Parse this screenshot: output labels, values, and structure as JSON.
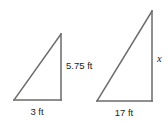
{
  "figure": {
    "background_color": "#ffffff",
    "stroke_color": "#6a6a6a",
    "text_color": "#1c1c1c",
    "title": "",
    "small_triangle": {
      "name": "small-right-triangle",
      "base_label": "3 ft",
      "height_label": "5.75 ft",
      "hypotenuse_label": "",
      "vertices": {
        "bottom_left": [
          14,
          100
        ],
        "bottom_right": [
          61,
          100
        ],
        "apex": [
          61,
          34
        ]
      }
    },
    "large_triangle": {
      "name": "large-right-triangle",
      "base_label": "17 ft",
      "height_label": "x",
      "hypotenuse_label": "",
      "vertices": {
        "bottom_left": [
          97,
          101
        ],
        "bottom_right": [
          152,
          101
        ],
        "apex": [
          152,
          11
        ]
      }
    },
    "labels": [
      {
        "id": "small-height",
        "text": "5.75 ft",
        "x": 66,
        "y": 69
      },
      {
        "id": "small-base",
        "text": "3 ft",
        "x": 28,
        "y": 115
      },
      {
        "id": "large-height",
        "text": "x",
        "x": 156,
        "y": 62
      },
      {
        "id": "large-base",
        "text": "17 ft",
        "x": 109,
        "y": 116
      }
    ]
  }
}
